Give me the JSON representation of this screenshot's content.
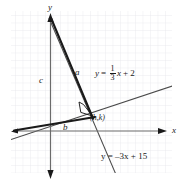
{
  "figure": {
    "type": "coordinate-plane-diagram",
    "background_color": "#ffffff",
    "grid_color": "#e9e9ee",
    "axis_color": "#6b6b6b",
    "line_color": "#4a4a4a",
    "bold_color": "#1a1a1a",
    "axes": {
      "x_label": "x",
      "y_label": "y"
    },
    "labels": {
      "side_a": "a",
      "side_b": "b",
      "side_c": "c",
      "point": "(h,k)"
    },
    "equations": {
      "line1": {
        "lhs": "y",
        "eq": "=",
        "numerator": "1",
        "denominator": "3",
        "var": "x",
        "plus": "+",
        "constant": "2",
        "plain": "y = 1/3 x + 2"
      },
      "line2": {
        "text": "y = –3x + 15",
        "plain": "y = -3x + 15"
      }
    }
  }
}
